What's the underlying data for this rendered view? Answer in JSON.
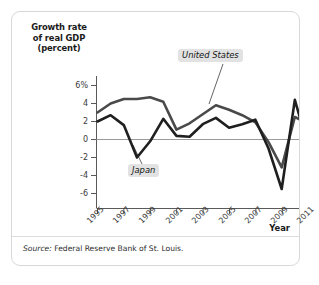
{
  "figure": {
    "source_prefix": "Source:",
    "source_text": "Federal Reserve Bank of St. Louis."
  },
  "chart_data": {
    "type": "line",
    "title": "",
    "title_lines": [
      "Growth rate",
      "of real GDP",
      "(percent)"
    ],
    "xlabel": "Year",
    "ylabel": "Growth rate of real GDP (percent)",
    "x": [
      1995,
      1996,
      1997,
      1998,
      1999,
      2000,
      2001,
      2002,
      2003,
      2004,
      2005,
      2006,
      2007,
      2008,
      2009,
      2010,
      2011
    ],
    "xlim": [
      1995,
      2011
    ],
    "ylim": [
      -7,
      6.5
    ],
    "xticks": [
      1995,
      1997,
      1999,
      2001,
      2003,
      2005,
      2007,
      2009,
      2011
    ],
    "xticklabels": [
      "1995",
      "1997",
      "1999",
      "2001",
      "2003",
      "2005",
      "2007",
      "2009",
      "2011"
    ],
    "yticks": [
      6,
      4,
      2,
      0,
      -2,
      -4,
      -6
    ],
    "yticklabels": [
      "6%",
      "4",
      "2",
      "0",
      "-2",
      "-4",
      "-6"
    ],
    "grid": false,
    "zero_line": true,
    "legend_position": "inline-callout",
    "series": [
      {
        "name": "United States",
        "color": "#4a4a4a",
        "values": [
          3.0,
          4.0,
          4.5,
          4.5,
          4.7,
          4.2,
          1.1,
          1.8,
          2.8,
          3.8,
          3.3,
          2.7,
          1.9,
          -0.3,
          -3.1,
          2.5,
          1.8
        ]
      },
      {
        "name": "Japan",
        "color": "#1f1f1f",
        "values": [
          2.0,
          2.7,
          1.6,
          -2.0,
          -0.2,
          2.3,
          0.4,
          0.3,
          1.7,
          2.4,
          1.3,
          1.7,
          2.2,
          -1.0,
          -5.5,
          4.4,
          -0.7
        ]
      }
    ],
    "annotations": [
      {
        "label": "United States",
        "series": "United States"
      },
      {
        "label": "Japan",
        "series": "Japan"
      }
    ]
  }
}
